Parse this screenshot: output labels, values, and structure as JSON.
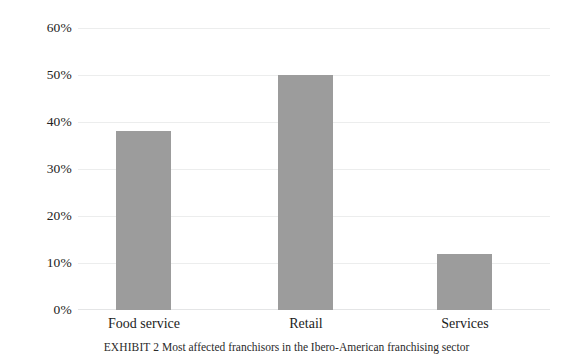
{
  "chart_data": {
    "type": "bar",
    "title": "",
    "subtitle": "",
    "categories": [
      "Food service",
      "Retail",
      "Services"
    ],
    "values": [
      38,
      50,
      12
    ],
    "series": [
      {
        "name": "Share of most affected franchisors",
        "values": [
          38,
          50,
          12
        ]
      }
    ],
    "xlabel": "",
    "ylabel": "",
    "ylim": [
      0,
      60
    ],
    "ytick_values": [
      60,
      50,
      40,
      30,
      20,
      10,
      0
    ],
    "ytick_labels": [
      "60%",
      "50%",
      "40%",
      "30%",
      "20%",
      "10%",
      "0%"
    ],
    "grid": true,
    "legend": false,
    "legend_position": "none",
    "bar_color": "#9c9c9c",
    "gridline_color": "#eceded",
    "background_color": "#ffffff",
    "annotations": []
  },
  "caption": {
    "label": "EXHIBIT 2",
    "text": "Most affected franchisors in the Ibero-American franchising sector",
    "full": "EXHIBIT 2 Most affected franchisors in the Ibero-American franchising sector"
  }
}
